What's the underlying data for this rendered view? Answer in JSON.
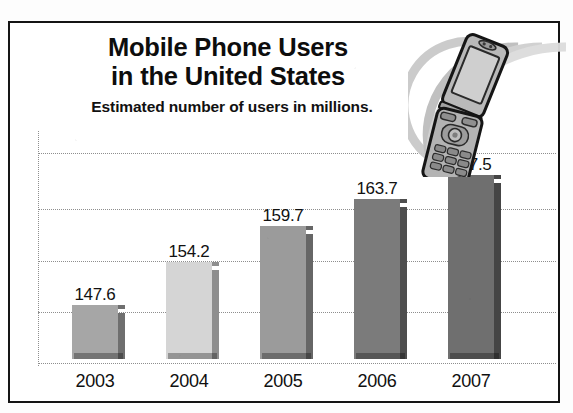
{
  "chart_data": {
    "type": "bar",
    "title": "Mobile Phone Users in the United States",
    "title_lines": [
      "Mobile Phone Users",
      "in the United States"
    ],
    "subtitle": "Estimated number of users in millions.",
    "xlabel": "",
    "ylabel": "",
    "unit": "millions",
    "categories": [
      "2003",
      "2004",
      "2005",
      "2006",
      "2007"
    ],
    "values": [
      147.6,
      154.2,
      159.7,
      163.7,
      167.5
    ],
    "value_labels": [
      "147.6",
      "154.2",
      "159.7",
      "163.7",
      "167.5"
    ],
    "ylim": [
      140,
      172
    ],
    "grid": true,
    "gridlines": 5,
    "legend": "none",
    "bar_colors": [
      "#a6a6a6",
      "#d5d5d5",
      "#9b9b9b",
      "#7b7b7b",
      "#6f6f6f"
    ],
    "bar_side_colors": [
      "#6f6f6f",
      "#8e8e8e",
      "#666666",
      "#4e4e4e",
      "#454545"
    ]
  },
  "illustration": {
    "name": "flip-phone-with-signal-waves",
    "description": "Tilted clamshell mobile phone with concentric signal arcs"
  },
  "style": {
    "background": "#ffffff",
    "border_color": "#141414",
    "text_color": "#111111",
    "grid_color": "#8e8e8e"
  }
}
